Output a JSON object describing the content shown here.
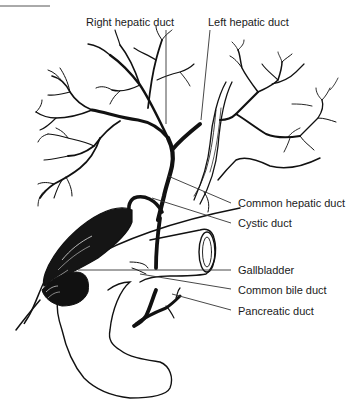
{
  "diagram": {
    "type": "anatomical-illustration",
    "colors": {
      "ink": "#111111",
      "background": "#ffffff",
      "leader": "#333333"
    },
    "labels": [
      {
        "id": "right-hepatic-duct",
        "text": "Right hepatic duct"
      },
      {
        "id": "left-hepatic-duct",
        "text": "Left hepatic duct"
      },
      {
        "id": "common-hepatic-duct",
        "text": "Common hepatic duct"
      },
      {
        "id": "cystic-duct",
        "text": "Cystic duct"
      },
      {
        "id": "gallbladder",
        "text": "Gallbladder"
      },
      {
        "id": "common-bile-duct",
        "text": "Common bile duct"
      },
      {
        "id": "pancreatic-duct",
        "text": "Pancreatic duct"
      }
    ]
  }
}
